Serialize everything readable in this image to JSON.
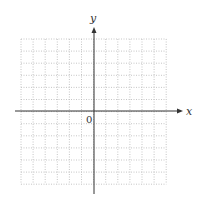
{
  "diagram": {
    "type": "cartesian-grid",
    "x_axis_label": "x",
    "y_axis_label": "y",
    "origin_label": "0",
    "grid": {
      "columns": 12,
      "rows": 12,
      "left": 21,
      "top": 39,
      "cell": 12.1,
      "line_style": "dotted",
      "line_color": "#b8b8b8"
    },
    "axes": {
      "color": "#333333",
      "origin_px": [
        94,
        111
      ],
      "x_extent_px": [
        15,
        183
      ],
      "y_extent_px": [
        27,
        194
      ]
    }
  }
}
